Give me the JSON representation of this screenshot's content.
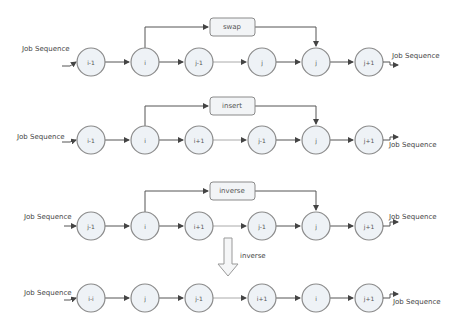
{
  "diagram": {
    "io_label": "Job Sequence",
    "transition": {
      "label": "inverse"
    },
    "rows": [
      {
        "name": "swap",
        "operation": "swap",
        "nodes": [
          "i-1",
          "i",
          "j-1",
          "j",
          "j",
          "j+1"
        ]
      },
      {
        "name": "insert",
        "operation": "insert",
        "nodes": [
          "i-1",
          "i",
          "i+1",
          "j-1",
          "j",
          "j+1"
        ]
      },
      {
        "name": "inverse",
        "operation": "inverse",
        "nodes": [
          "j-1",
          "i",
          "i+1",
          "j-1",
          "j",
          "j+1"
        ]
      },
      {
        "name": "result",
        "operation": null,
        "nodes": [
          "i-i",
          "j",
          "j-1",
          "i+1",
          "i",
          "j+1"
        ]
      }
    ]
  },
  "colors": {
    "node_fill": "#eef2f6",
    "node_stroke": "#8a8a8a",
    "edge": "#555555",
    "text": "#444444"
  }
}
